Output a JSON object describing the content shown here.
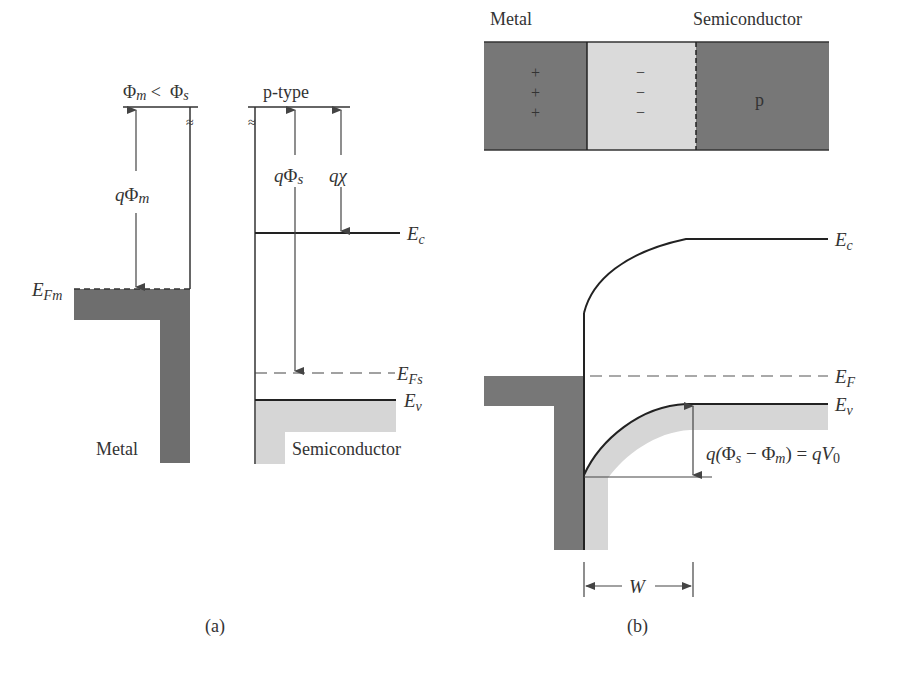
{
  "colors": {
    "metal_fill": "#6e6e6e",
    "metal_fill_b": "#777777",
    "semiconductor_fill": "#d6d6d6",
    "depletion_fill": "#d9d9d9",
    "p_region_fill": "#777777",
    "line": "#222222",
    "arrow": "#444444"
  },
  "panel_a": {
    "caption": "(a)",
    "condition": {
      "phi_m": "Φ",
      "m_sub": "m",
      "lt": " <  ",
      "phi_s": "Φ",
      "s_sub": "s"
    },
    "semiconductor_type": "p-type",
    "q_phi_m": {
      "q": "q",
      "phi": "Φ",
      "sub": "m"
    },
    "q_phi_s": {
      "q": "q",
      "phi": "Φ",
      "sub": "s"
    },
    "q_chi": {
      "q": "q",
      "chi": "χ"
    },
    "E_c": {
      "E": "E",
      "sub": "c"
    },
    "E_Fm": {
      "E": "E",
      "sub": "Fm"
    },
    "E_Fs": {
      "E": "E",
      "sub": "Fs"
    },
    "E_v": {
      "E": "E",
      "sub": "v"
    },
    "metal_label": "Metal",
    "semiconductor_label": "Semiconductor",
    "break_symbol": "≈"
  },
  "panel_b": {
    "caption": "(b)",
    "top_metal_label": "Metal",
    "top_semiconductor_label": "Semiconductor",
    "plus_signs": [
      "+",
      "+",
      "+"
    ],
    "minus_signs": [
      "−",
      "−",
      "−"
    ],
    "p_label": "p",
    "E_c": {
      "E": "E",
      "sub": "c"
    },
    "E_F": {
      "E": "E",
      "sub": "F"
    },
    "E_v": {
      "E": "E",
      "sub": "v"
    },
    "barrier": {
      "q1": "q(",
      "phi_s": "Φ",
      "s_sub": "s",
      "minus": " − ",
      "phi_m": "Φ",
      "m_sub": "m",
      "eq": ") = ",
      "q2": "qV",
      "zero_sub": "0"
    },
    "width_label": "W"
  }
}
